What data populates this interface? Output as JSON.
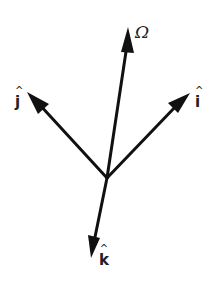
{
  "diagram": {
    "type": "vector-diagram",
    "origin": {
      "x": 107,
      "y": 178
    },
    "vectors": [
      {
        "id": "omega",
        "label": "Ω",
        "hat": "",
        "tip": {
          "x": 128,
          "y": 27
        }
      },
      {
        "id": "i",
        "label": "i",
        "hat": "^",
        "tip": {
          "x": 190,
          "y": 93
        }
      },
      {
        "id": "j",
        "label": "j",
        "hat": "^",
        "tip": {
          "x": 27,
          "y": 92
        }
      },
      {
        "id": "k",
        "label": "k",
        "hat": "^",
        "tip": {
          "x": 91,
          "y": 258
        }
      }
    ],
    "colors": {
      "stroke": "#111111",
      "label": "#222222",
      "background": "#ffffff"
    }
  }
}
